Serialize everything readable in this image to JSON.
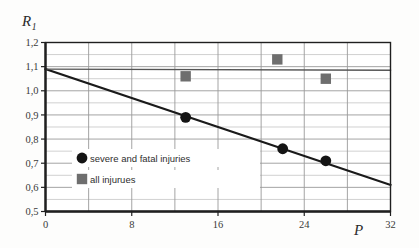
{
  "chart_data": {
    "type": "scatter",
    "title": "",
    "xlabel": "P",
    "ylabel": "R1",
    "ylabel_base": "R",
    "ylabel_sub": "1",
    "xlim": [
      0,
      32
    ],
    "ylim": [
      0.5,
      1.2
    ],
    "grid": true,
    "x_major_ticks": [
      0,
      8,
      16,
      24,
      32
    ],
    "x_major_tick_labels": [
      "0",
      "8",
      "16",
      "24",
      "32"
    ],
    "x_gridlines": [
      0,
      4,
      8,
      12,
      16,
      20,
      24,
      28,
      32
    ],
    "y_major_ticks": [
      0.5,
      0.6,
      0.7,
      0.8,
      0.9,
      1.0,
      1.1,
      1.2
    ],
    "y_major_tick_labels": [
      "0,5",
      "0,6",
      "0,7",
      "0,8",
      "0,9",
      "1,0",
      "1,1",
      "1,2"
    ],
    "y_minor_gridlines": [
      0.55,
      0.65,
      0.75,
      0.85,
      0.95,
      1.05,
      1.15
    ],
    "legend_position": "inside-lower-left",
    "series": [
      {
        "name": "severe and fatal injuries",
        "marker": "circle",
        "color": "#141414",
        "points": [
          {
            "x": 13.0,
            "y": 0.89
          },
          {
            "x": 22.0,
            "y": 0.76
          },
          {
            "x": 26.0,
            "y": 0.71
          }
        ]
      },
      {
        "name": "all injurues",
        "marker": "square",
        "color": "#6e6e6e",
        "points": [
          {
            "x": 13.0,
            "y": 1.06
          },
          {
            "x": 21.5,
            "y": 1.13
          },
          {
            "x": 26.0,
            "y": 1.05
          }
        ]
      }
    ],
    "lines": [
      {
        "name": "regression-trend-line",
        "color": "#1a1a1a",
        "width": 2.0,
        "from": {
          "x": 0,
          "y": 1.09
        },
        "to": {
          "x": 32,
          "y": 0.61
        }
      },
      {
        "name": "reference-level-line",
        "color": "#555555",
        "width": 1.3,
        "from": {
          "x": 0,
          "y": 1.09
        },
        "to": {
          "x": 32,
          "y": 1.085
        }
      }
    ],
    "colors": {
      "frame": "#1f1f1f",
      "grid": "#9a9a9a",
      "minor_grid": "#bcbcbc",
      "background": "#fdfdfc",
      "circle_marker": "#141414",
      "square_marker": "#6e6e6e"
    }
  },
  "legend": {
    "items": [
      {
        "label": "severe and fatal injuries",
        "marker": "circle"
      },
      {
        "label": "all injurues",
        "marker": "square"
      }
    ]
  }
}
